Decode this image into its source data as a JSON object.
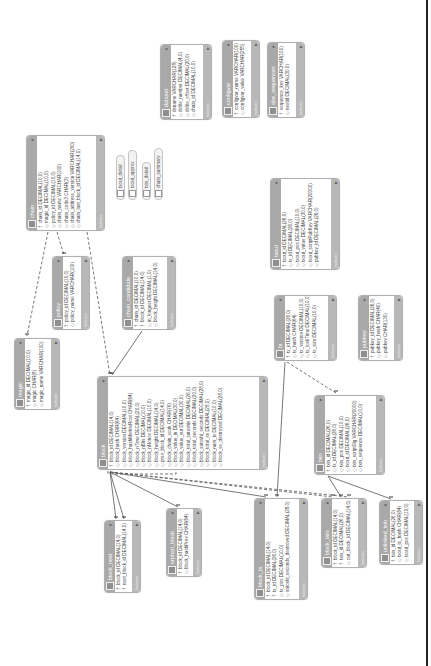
{
  "diagram": {
    "type": "database-er-diagram",
    "orientation": "rotated-90-ccw",
    "colors": {
      "header": "#a9a9a9",
      "footer": "#b8b8b8",
      "body": "#ffffff",
      "line": "#555555"
    },
    "footer_label": "Indexes",
    "tables": [
      {
        "id": "dataset",
        "name": "dataset",
        "x": 160,
        "y": 44,
        "w": 52,
        "h": 76,
        "columns": [
          {
            "key": "†",
            "text": "dsname VARCHAR(128)"
          },
          {
            "key": "◇",
            "text": "dsfile_number DECIMAL(4,0)"
          },
          {
            "key": "◇",
            "text": "dsfile_offset DECIMAL(20,0)"
          },
          {
            "key": "◇",
            "text": "chain_id DECIMAL(10,0)"
          }
        ]
      },
      {
        "id": "configvar",
        "name": "configvar",
        "x": 222,
        "y": 40,
        "w": 38,
        "h": 78,
        "columns": [
          {
            "key": "†",
            "text": "configvar_name VARCHAR(100)"
          },
          {
            "key": "◇",
            "text": "configvar_value VARCHAR(255)"
          }
        ]
      },
      {
        "id": "abe_sequences",
        "name": "abe_sequences",
        "x": 267,
        "y": 42,
        "w": 38,
        "h": 76,
        "columns": [
          {
            "key": "†",
            "text": "sequence_key VARCHAR(100)"
          },
          {
            "key": "◇",
            "text": "nextid DECIMAL(30,0)"
          }
        ]
      },
      {
        "id": "chain",
        "name": "chain",
        "x": 26,
        "y": 135,
        "w": 79,
        "h": 96,
        "columns": [
          {
            "key": "†",
            "text": "chain_id DECIMAL(10,0)"
          },
          {
            "key": "◇",
            "text": "magic_id DECIMAL(10,0)"
          },
          {
            "key": "◇",
            "text": "policy_id DECIMAL(10,0)"
          },
          {
            "key": "◇",
            "text": "chain_name VARCHAR(100)"
          },
          {
            "key": "◇",
            "text": "chain_code3 CHAR(3)"
          },
          {
            "key": "◇",
            "text": "chain_address_version VARCHAR(200)"
          },
          {
            "key": "◇",
            "text": "chain_last_block_id DECIMAL(14,0)"
          }
        ]
      },
      {
        "id": "pubkey_policy",
        "name": "policy",
        "x": 52,
        "y": 256,
        "w": 38,
        "h": 74,
        "columns": [
          {
            "key": "†",
            "text": "policy_id DECIMAL(10,0)"
          },
          {
            "key": "◇",
            "text": "policy_name VARCHAR(100)"
          }
        ]
      },
      {
        "id": "chain_candidate",
        "name": "chain_candidate",
        "x": 122,
        "y": 256,
        "w": 54,
        "h": 74,
        "columns": [
          {
            "key": "†",
            "text": "chain_id DECIMAL(10,0)"
          },
          {
            "key": "†",
            "text": "block_id DECIMAL(14,0)"
          },
          {
            "key": "◇",
            "text": "in_longest DECIMAL(1,0)"
          },
          {
            "key": "◇",
            "text": "block_height DECIMAL(14,0)"
          }
        ]
      },
      {
        "id": "txout",
        "name": "txout",
        "x": 270,
        "y": 178,
        "w": 70,
        "h": 92,
        "columns": [
          {
            "key": "†",
            "text": "txout_id DECIMAL(26,0)"
          },
          {
            "key": "◇",
            "text": "tx_id DECIMAL(26,0)"
          },
          {
            "key": "◇",
            "text": "txout_pos DECIMAL(10,0)"
          },
          {
            "key": "◇",
            "text": "txout_value DECIMAL(30,0)"
          },
          {
            "key": "◇",
            "text": "txout_scriptPubKey VARCHAR(20000)"
          },
          {
            "key": "◇",
            "text": "pubkey_id DECIMAL(26,0)"
          }
        ]
      },
      {
        "id": "magic",
        "name": "magic",
        "x": 14,
        "y": 338,
        "w": 46,
        "h": 72,
        "columns": [
          {
            "key": "†",
            "text": "magic_id DECIMAL(10,0)"
          },
          {
            "key": "◇",
            "text": "magic CHAR(8)"
          },
          {
            "key": "◇",
            "text": "magic_name VARCHAR(100)"
          }
        ]
      },
      {
        "id": "tx",
        "name": "tx",
        "x": 274,
        "y": 295,
        "w": 63,
        "h": 66,
        "columns": [
          {
            "key": "†",
            "text": "tx_id DECIMAL(26,0)"
          },
          {
            "key": "◇",
            "text": "tx_hash CHAR(64)"
          },
          {
            "key": "◇",
            "text": "tx_version DECIMAL(10,0)"
          },
          {
            "key": "◇",
            "text": "tx_lockTime DECIMAL(10,0)"
          },
          {
            "key": "◇",
            "text": "tx_size DECIMAL(10,0)"
          }
        ]
      },
      {
        "id": "pubkey",
        "name": "pubkey",
        "x": 358,
        "y": 295,
        "w": 45,
        "h": 66,
        "columns": [
          {
            "key": "†",
            "text": "pubkey_id DECIMAL(26,0)"
          },
          {
            "key": "◇",
            "text": "pubkey_hash CHAR(40)"
          },
          {
            "key": "◇",
            "text": "pubkey CHAR(130)"
          }
        ]
      },
      {
        "id": "block",
        "name": "block",
        "x": 97,
        "y": 376,
        "w": 171,
        "h": 94,
        "columns": [
          {
            "key": "†",
            "text": "block_id DECIMAL(14,0)"
          },
          {
            "key": "◇",
            "text": "block_hash CHAR(64)"
          },
          {
            "key": "◇",
            "text": "block_version DECIMAL(10,0)"
          },
          {
            "key": "◇",
            "text": "block_hashMerkleRoot CHAR(64)"
          },
          {
            "key": "◇",
            "text": "block_nTime DECIMAL(20,0)"
          },
          {
            "key": "◇",
            "text": "block_nBits DECIMAL(10,0)"
          },
          {
            "key": "◇",
            "text": "block_nNonce DECIMAL(10,0)"
          },
          {
            "key": "◇",
            "text": "block_height DECIMAL(14,0)"
          },
          {
            "key": "◇",
            "text": "prev_block_id DECIMAL(14,0)"
          },
          {
            "key": "◇",
            "text": "block_chain_work CHAR(76)"
          },
          {
            "key": "◇",
            "text": "block_value_in DECIMAL(30,0)"
          },
          {
            "key": "◇",
            "text": "block_value_out DECIMAL(30,0)"
          },
          {
            "key": "◇",
            "text": "block_total_satoshis DECIMAL(26,0)"
          },
          {
            "key": "◇",
            "text": "block_total_seconds DECIMAL(20,0)"
          },
          {
            "key": "◇",
            "text": "block_satoshi_seconds DECIMAL(28,0)"
          },
          {
            "key": "◇",
            "text": "block_total_ss DECIMAL(28,0)"
          },
          {
            "key": "◇",
            "text": "block_num_tx DECIMAL(10,0)"
          },
          {
            "key": "◇",
            "text": "block_ss_destroyed DECIMAL(28,0)"
          }
        ]
      },
      {
        "id": "txin",
        "name": "txin",
        "x": 314,
        "y": 395,
        "w": 71,
        "h": 80,
        "columns": [
          {
            "key": "†",
            "text": "txin_id DECIMAL(26,0)"
          },
          {
            "key": "◇",
            "text": "tx_id DECIMAL(26,0)"
          },
          {
            "key": "◇",
            "text": "txin_pos DECIMAL(10,0)"
          },
          {
            "key": "◇",
            "text": "txout_id DECIMAL(26,0)"
          },
          {
            "key": "◇",
            "text": "txin_scriptSig VARCHAR(20000)"
          },
          {
            "key": "◇",
            "text": "txin_sequence DECIMAL(10,0)"
          }
        ]
      },
      {
        "id": "block_next",
        "name": "block_next",
        "x": 104,
        "y": 520,
        "w": 37,
        "h": 73,
        "columns": [
          {
            "key": "†",
            "text": "block_id DECIMAL(14,0)"
          },
          {
            "key": "†",
            "text": "next_block_id DECIMAL(14,0)"
          }
        ]
      },
      {
        "id": "orphan_block",
        "name": "orphan_block",
        "x": 166,
        "y": 508,
        "w": 36,
        "h": 69,
        "columns": [
          {
            "key": "†",
            "text": "block_id DECIMAL(14,0)"
          },
          {
            "key": "◇",
            "text": "block_hashPrev CHAR(64)"
          }
        ]
      },
      {
        "id": "block_tx",
        "name": "block_tx",
        "x": 254,
        "y": 498,
        "w": 54,
        "h": 102,
        "columns": [
          {
            "key": "†",
            "text": "block_id DECIMAL(14,0)"
          },
          {
            "key": "†",
            "text": "tx_id DECIMAL(26,0)"
          },
          {
            "key": "◇",
            "text": "tx_pos DECIMAL(10,0)"
          },
          {
            "key": "◇",
            "text": "satoshi_seconds_destroyed DECIMAL(28,0)"
          }
        ]
      },
      {
        "id": "block_txin",
        "name": "block_txin",
        "x": 321,
        "y": 498,
        "w": 46,
        "h": 70,
        "columns": [
          {
            "key": "†",
            "text": "block_id DECIMAL(14,0)"
          },
          {
            "key": "†",
            "text": "txin_id DECIMAL(26,0)"
          },
          {
            "key": "◇",
            "text": "out_block_id DECIMAL(14,0)"
          }
        ]
      },
      {
        "id": "unlinked_txin",
        "name": "unlinked_txin",
        "x": 379,
        "y": 500,
        "w": 44,
        "h": 65,
        "columns": [
          {
            "key": "†",
            "text": "txin_id DECIMAL(26,0)"
          },
          {
            "key": "◇",
            "text": "txout_tx_hash CHAR(64)"
          },
          {
            "key": "◇",
            "text": "txout_pos DECIMAL(10,0)"
          }
        ]
      }
    ],
    "views": [
      {
        "name": "txout_detail",
        "x": 116,
        "y": 155,
        "w": 8,
        "h": 45
      },
      {
        "name": "txout_approx",
        "x": 128,
        "y": 150,
        "w": 8,
        "h": 50
      },
      {
        "name": "txin_detail",
        "x": 142,
        "y": 162,
        "w": 8,
        "h": 38
      },
      {
        "name": "chain_summary",
        "x": 154,
        "y": 148,
        "w": 8,
        "h": 52
      }
    ],
    "relationships": [
      {
        "from": "chain",
        "to": "magic",
        "style": "dashed",
        "points": [
          [
            48,
            232
          ],
          [
            27,
            336
          ]
        ]
      },
      {
        "from": "chain",
        "to": "policy",
        "style": "dashed",
        "points": [
          [
            57,
            232
          ],
          [
            64,
            255
          ]
        ]
      },
      {
        "from": "chain",
        "to": "block",
        "style": "dashed",
        "points": [
          [
            87,
            232
          ],
          [
            110,
            375
          ]
        ]
      },
      {
        "from": "chain_candidate",
        "to": "block",
        "style": "solid",
        "points": [
          [
            142,
            331
          ],
          [
            112,
            375
          ]
        ]
      },
      {
        "from": "block",
        "to": "block",
        "style": "dashed",
        "points": [
          [
            108,
            471
          ],
          [
            108,
            474
          ],
          [
            176,
            474
          ],
          [
            176,
            471
          ]
        ]
      },
      {
        "from": "block",
        "to": "block_next",
        "style": "solid",
        "points": [
          [
            110,
            472
          ],
          [
            116,
            519
          ]
        ]
      },
      {
        "from": "block",
        "to": "block_next",
        "style": "solid",
        "points": [
          [
            110,
            472
          ],
          [
            124,
            519
          ]
        ]
      },
      {
        "from": "block",
        "to": "orphan_block",
        "style": "solid",
        "points": [
          [
            110,
            472
          ],
          [
            178,
            507
          ]
        ]
      },
      {
        "from": "block",
        "to": "block_tx",
        "style": "solid",
        "points": [
          [
            110,
            472
          ],
          [
            266,
            497
          ]
        ]
      },
      {
        "from": "block",
        "to": "block_txin",
        "style": "dashed",
        "points": [
          [
            110,
            472
          ],
          [
            333,
            497
          ]
        ]
      },
      {
        "from": "block",
        "to": "block_txin",
        "style": "dashed",
        "points": [
          [
            110,
            472
          ],
          [
            349,
            497
          ]
        ]
      },
      {
        "from": "tx",
        "to": "block_tx",
        "style": "solid",
        "points": [
          [
            285,
            362
          ],
          [
            277,
            497
          ]
        ]
      },
      {
        "from": "tx",
        "to": "txin",
        "style": "dashed",
        "points": [
          [
            287,
            362
          ],
          [
            336,
            393
          ]
        ]
      },
      {
        "from": "txin",
        "to": "block_txin",
        "style": "solid",
        "points": [
          [
            328,
            476
          ],
          [
            341,
            497
          ]
        ]
      },
      {
        "from": "txin",
        "to": "unlinked_txin",
        "style": "solid",
        "points": [
          [
            328,
            476
          ],
          [
            391,
            499
          ]
        ]
      }
    ]
  }
}
